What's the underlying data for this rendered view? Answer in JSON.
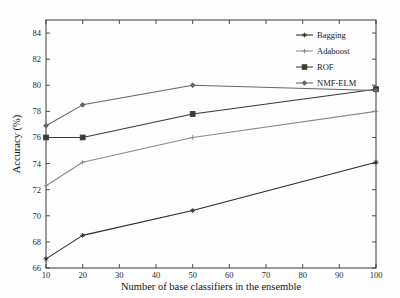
{
  "chart_data": {
    "type": "line",
    "title": "",
    "xlabel": "Number of base classifiers in the ensemble",
    "ylabel": "Accuracy (%)",
    "x": [
      10,
      20,
      50,
      100
    ],
    "xlim": [
      10,
      100
    ],
    "ylim": [
      66,
      85
    ],
    "xticks": [
      10,
      20,
      30,
      40,
      50,
      60,
      70,
      80,
      90,
      100
    ],
    "xtick_labels": [
      "10",
      "20",
      "30",
      "40",
      "50",
      "60",
      "70",
      "80",
      "90",
      "100"
    ],
    "yticks": [
      66,
      68,
      70,
      72,
      74,
      76,
      78,
      80,
      82,
      84
    ],
    "ytick_labels": [
      "66",
      "68",
      "70",
      "72",
      "74",
      "76",
      "78",
      "80",
      "82",
      "84"
    ],
    "grid": false,
    "legend_position": "top-right",
    "series": [
      {
        "name": "Bagging",
        "values": [
          66.7,
          68.5,
          70.4,
          74.1
        ],
        "color": "#2a2a2a",
        "marker": "star"
      },
      {
        "name": "Adaboost",
        "values": [
          72.3,
          74.1,
          76.0,
          78.0
        ],
        "color": "#8a8a8a",
        "marker": "plus"
      },
      {
        "name": "ROF",
        "values": [
          76.0,
          76.0,
          77.8,
          79.7
        ],
        "color": "#3a3a3a",
        "marker": "square"
      },
      {
        "name": "NMF-ELM",
        "values": [
          76.9,
          78.5,
          80.0,
          79.6
        ],
        "color": "#666666",
        "marker": "diamond"
      }
    ]
  },
  "legend": {
    "entries": [
      {
        "label": "Bagging"
      },
      {
        "label": "Adaboost"
      },
      {
        "label": "ROF"
      },
      {
        "label": "NMF-ELM"
      }
    ]
  }
}
